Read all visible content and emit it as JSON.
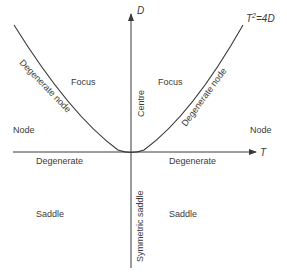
{
  "diagram": {
    "type": "trace-determinant stability diagram",
    "axes": {
      "x_label": "T",
      "y_label": "D"
    },
    "curve_label": "T² = 4D",
    "curve_label_parts": {
      "base": "T",
      "exp": "2",
      "rest": "=4D"
    },
    "regions": {
      "focus_left": "Focus",
      "focus_right": "Focus",
      "centre": "Centre",
      "node_left": "Node",
      "node_right": "Node",
      "degenerate_node_left": "Degenerate node",
      "degenerate_node_right": "Degenerate node",
      "degenerate_left": "Degenerate",
      "degenerate_right": "Degenerate",
      "saddle_left": "Saddle",
      "saddle_right": "Saddle",
      "symmetric_saddle": "Symmetric saddle"
    },
    "colors": {
      "line": "#3a3a3a",
      "text": "#3a3a3a",
      "background": "#ffffff"
    }
  }
}
